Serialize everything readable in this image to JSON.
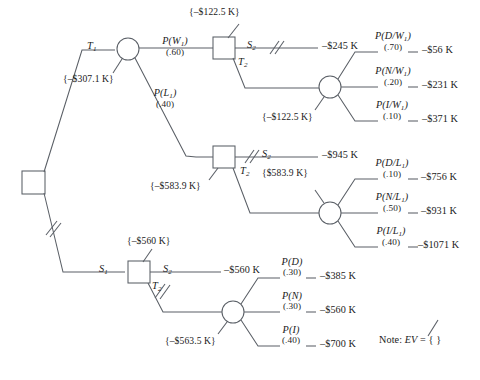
{
  "diagram": {
    "note": "Note: EV = {  }",
    "note_prefix": "Note:",
    "note_ev": "EV",
    "note_eq": "= {    }"
  },
  "nodes": {
    "root": {
      "name": "root-decision-node",
      "type": "decision",
      "x": 33,
      "y": 182
    },
    "d_top": {
      "name": "decision-node-w1",
      "type": "decision",
      "x": 224,
      "y": 48,
      "ev": "{–$122.5 K}"
    },
    "d_mid": {
      "name": "decision-node-l1",
      "type": "decision",
      "x": 224,
      "y": 157,
      "ev": "{–$583.9 K}"
    },
    "d_bot": {
      "name": "decision-node-s1",
      "type": "decision",
      "x": 139,
      "y": 272,
      "ev": "{–$560 K}"
    },
    "c_t1": {
      "name": "chance-node-t1",
      "type": "chance",
      "x": 128,
      "y": 49,
      "ev": "{–$307.1 K}"
    },
    "c_w1": {
      "name": "chance-node-w1-outcomes",
      "type": "chance",
      "x": 330,
      "y": 87,
      "ev": "{–$122.5 K}"
    },
    "c_l1": {
      "name": "chance-node-l1-outcomes",
      "type": "chance",
      "x": 330,
      "y": 213,
      "ev": "{$583.9 K}"
    },
    "c_s2": {
      "name": "chance-node-s2-outcomes",
      "type": "chance",
      "x": 233,
      "y": 312,
      "ev": "{–$563.5 K}"
    }
  },
  "branch_labels": {
    "t1": {
      "text": "T",
      "sub": "1"
    },
    "s1": {
      "text": "S",
      "sub": "1"
    },
    "t2_top": {
      "text": "T",
      "sub": "2"
    },
    "t2_mid": {
      "text": "T",
      "sub": "2"
    },
    "t2_bot": {
      "text": "T",
      "sub": "2"
    },
    "s2_top": {
      "text": "S",
      "sub": "2"
    },
    "s2_mid": {
      "text": "S",
      "sub": "2"
    },
    "s2_bot": {
      "text": "S",
      "sub": "2"
    }
  },
  "probabilities": {
    "w1": {
      "label": "P(W",
      "sub": "1",
      "close": ")",
      "value": "(.60)"
    },
    "l1": {
      "label": "P(L",
      "sub": "1",
      "close": ")",
      "value": "(.40)"
    },
    "d_w1": {
      "label": "P(D/W",
      "sub": "1",
      "close": ")",
      "value": "(.70)"
    },
    "n_w1": {
      "label": "P(N/W",
      "sub": "1",
      "close": ")",
      "value": "(.20)"
    },
    "i_w1": {
      "label": "P(I/W",
      "sub": "1",
      "close": ")",
      "value": "(.10)"
    },
    "d_l1": {
      "label": "P(D/L",
      "sub": "1",
      "close": ")",
      "value": "(.10)"
    },
    "n_l1": {
      "label": "P(N/L",
      "sub": "1",
      "close": ")",
      "value": "(.50)"
    },
    "i_l1": {
      "label": "P(I/L",
      "sub": "1",
      "close": ")",
      "value": "(.40)"
    },
    "d": {
      "label": "P(D)",
      "sub": "",
      "close": "",
      "value": "(.30)"
    },
    "n": {
      "label": "P(N)",
      "sub": "",
      "close": "",
      "value": "(.30)"
    },
    "i": {
      "label": "P(I)",
      "sub": "",
      "close": "",
      "value": "(.40)"
    }
  },
  "payoffs": {
    "s2_top": "–$245 K",
    "d_w1": "–$56 K",
    "n_w1": "–$231 K",
    "i_w1": "–$371 K",
    "s2_mid": "–$945 K",
    "d_l1": "–$756 K",
    "n_l1": "–$931 K",
    "i_l1": "–$1071 K",
    "s2_bot": "–$560 K",
    "d": "–$385 K",
    "n": "–$560 K",
    "i": "–$700 K"
  },
  "expected_values": {
    "root_t1_chance": "{–$307.1 K}",
    "d_top": "{–$122.5 K}",
    "c_w1": "{–$122.5 K}",
    "d_mid": "{–$583.9 K}",
    "c_l1": "{$583.9 K}",
    "d_bot": "{–$560 K}",
    "c_s2": "{–$563.5 K}"
  },
  "pruned_branches": [
    {
      "name": "pruned-root-s1",
      "x": 50,
      "y": 228
    },
    {
      "name": "pruned-s2-top",
      "x": 274,
      "y": 48
    },
    {
      "name": "pruned-s2-mid",
      "x": 249,
      "y": 157
    },
    {
      "name": "pruned-t2-bot",
      "x": 162,
      "y": 292
    }
  ],
  "colors": {
    "stroke": "#5a5f66",
    "text": "#1b1b1b",
    "background": "#ffffff"
  }
}
